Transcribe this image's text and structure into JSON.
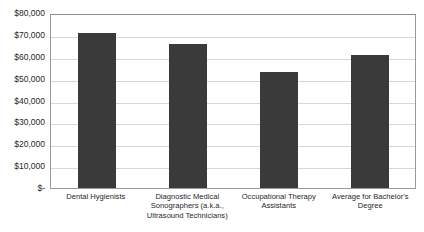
{
  "chart_data": {
    "type": "bar",
    "title": "",
    "xlabel": "",
    "ylabel": "",
    "grid": true,
    "legend": "none",
    "ylim": [
      0,
      80000
    ],
    "ytick_labels": [
      "$80,000",
      "$70,000",
      "$60,000",
      "$50,000",
      "$40,000",
      "$30,000",
      "$20,000",
      "$10,000",
      "$-"
    ],
    "ytick_values": [
      80000,
      70000,
      60000,
      50000,
      40000,
      30000,
      20000,
      10000,
      0
    ],
    "categories": [
      "Dental Hygienists",
      "Diagnostic Medical Sonographers (a.k.a., Ultrasound Technicians)",
      "Occupational Therapy Assistants",
      "Average for Bachelor's Degree"
    ],
    "values": [
      71000,
      66000,
      53000,
      61000
    ],
    "bar_color": "#3a3a3a",
    "gridline_color": "#d6d6d6",
    "plot_border_color": "#9a9a9a",
    "background_color": "#ffffff"
  }
}
